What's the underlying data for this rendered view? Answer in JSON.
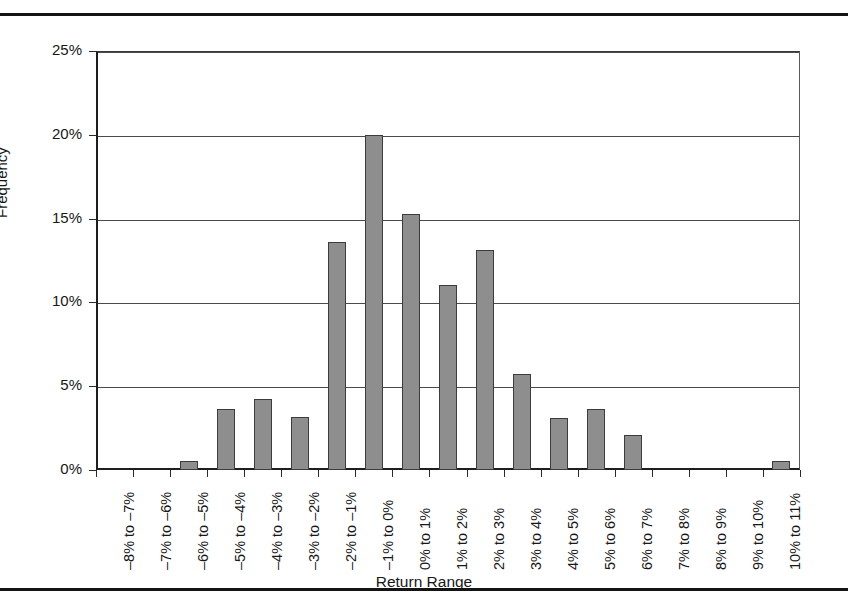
{
  "figure": {
    "top_rule": "",
    "bottom_rule": "",
    "axis_title": "Return Range",
    "y_axis_title": "Frequency"
  },
  "chart_data": {
    "type": "bar",
    "title": "",
    "subtitle": "",
    "xlabel": "Return Range",
    "ylabel": "Frequency",
    "ylim": [
      0,
      25
    ],
    "ytick_labels": [
      "0%",
      "5%",
      "10%",
      "15%",
      "20%",
      "25%"
    ],
    "ytick_values": [
      0,
      5,
      10,
      15,
      20,
      25
    ],
    "grid": true,
    "grid_axis": "y",
    "legend": false,
    "bar_color": "#8e8e8e",
    "bar_edge_color": "#3c3c3c",
    "categories": [
      "–8% to –7%",
      "–7% to –6%",
      "–6% to –5%",
      "–5% to –4%",
      "–4% to –3%",
      "–3% to –2%",
      "–2% to –1%",
      "–1% to 0%",
      "0% to 1%",
      "1% to 2%",
      "2% to 3%",
      "3% to 4%",
      "4% to 5%",
      "5% to 6%",
      "6% to 7%",
      "7% to 8%",
      "8% to 9%",
      "9% to 10%",
      "10% to 11%"
    ],
    "values": [
      0,
      0,
      0.55,
      3.65,
      4.25,
      3.15,
      13.6,
      20.0,
      15.25,
      11.05,
      13.1,
      5.75,
      3.1,
      3.65,
      2.1,
      0,
      0,
      0,
      0.55
    ],
    "value_unit": "%"
  }
}
